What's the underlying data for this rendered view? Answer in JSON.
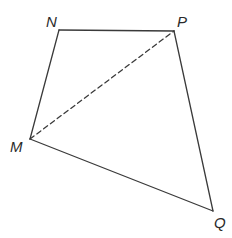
{
  "diagram": {
    "type": "quadrilateral",
    "stroke_color": "#3a3a3a",
    "vertices": {
      "N": {
        "label": "N",
        "x": 59,
        "y": 30,
        "lx": 46,
        "ly": 27
      },
      "P": {
        "label": "P",
        "x": 174,
        "y": 31,
        "lx": 177,
        "ly": 27
      },
      "M": {
        "label": "M",
        "x": 30,
        "y": 139,
        "lx": 10,
        "ly": 152
      },
      "Q": {
        "label": "Q",
        "x": 213,
        "y": 211,
        "lx": 214,
        "ly": 228
      }
    },
    "solid_edges": [
      [
        "N",
        "P"
      ],
      [
        "P",
        "Q"
      ],
      [
        "Q",
        "M"
      ],
      [
        "M",
        "N"
      ]
    ],
    "dashed_edges": [
      [
        "M",
        "P"
      ]
    ]
  }
}
